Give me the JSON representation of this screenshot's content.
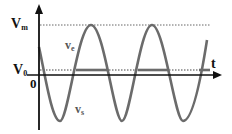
{
  "diagram": {
    "type": "waveform-plot",
    "axes": {
      "vertical_axis": "voltage",
      "horizontal_axis_label": "t",
      "origin_label": "0"
    },
    "levels": {
      "vm": {
        "label_main": "V",
        "label_sub": "m",
        "style": "dotted"
      },
      "v0": {
        "label_main": "V",
        "label_sub": "0",
        "style": "dotted"
      }
    },
    "curves": {
      "ve": {
        "label_main": "v",
        "label_sub": "e",
        "description": "sinusoidal input voltage"
      },
      "vs": {
        "label_main": "v",
        "label_sub": "s",
        "description": "output voltage (thick segments at V0)"
      }
    },
    "colors": {
      "axis": "#111111",
      "wave": "#6b6b6b",
      "dotted": "#555555"
    }
  }
}
